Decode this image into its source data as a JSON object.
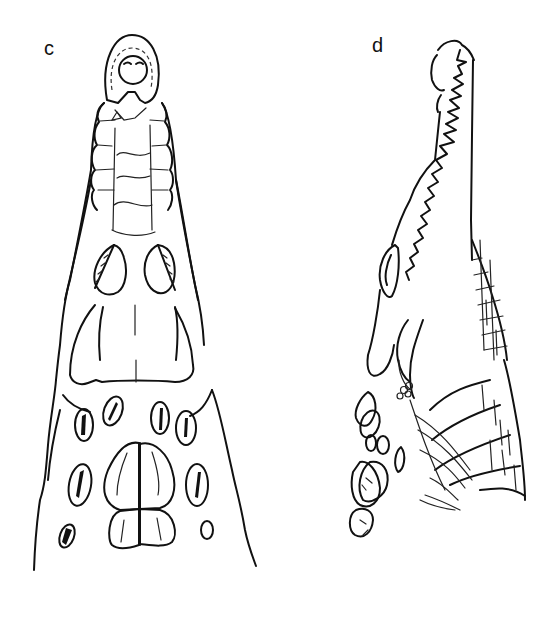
{
  "figure": {
    "panels": [
      {
        "label": "c",
        "description": "Crocodile head, dorsal view (top-down): snout with terminal nasal disc, eye orbits, and nuchal scutes"
      },
      {
        "label": "d",
        "description": "Crocodile head, lateral-oblique view: elongated toothed snout, eye, and scaled neck"
      }
    ],
    "colors": {
      "line": "#111111",
      "background": "#ffffff"
    }
  }
}
